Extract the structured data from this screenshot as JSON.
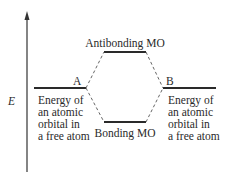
{
  "diagram": {
    "axis": {
      "label": "E",
      "direction": "up"
    },
    "levels": {
      "atom_a": {
        "label": "A",
        "description": [
          "Energy of",
          "an atomic",
          "orbital in",
          "a free atom"
        ]
      },
      "atom_b": {
        "label": "B",
        "description": [
          "Energy of",
          "an atomic",
          "orbital in",
          "a free atom"
        ]
      },
      "antibonding": {
        "label": "Antibonding MO"
      },
      "bonding": {
        "label": "Bonding MO"
      }
    },
    "colors": {
      "line": "#2a2a2a",
      "dashed": "#555555",
      "background": "#ffffff"
    }
  }
}
